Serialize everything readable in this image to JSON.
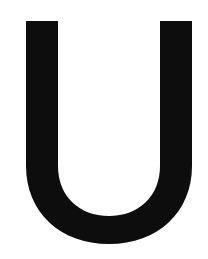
{
  "image": {
    "kind": "scanned-letterform",
    "subject": "capital letter U",
    "character": "U",
    "alt_text": "U",
    "width_px": 208,
    "height_px": 259
  },
  "colors": {
    "background": "#ffffff",
    "ink": "#0d0d0d",
    "ink_edge": "#1a1a1a"
  },
  "glyph": {
    "name": "letter-u",
    "case": "uppercase",
    "style": "sans-serif grotesque, very heavy weight",
    "counter_fill": "#ffffff",
    "metrics": {
      "left_stem_x_start": 26,
      "left_stem_x_end": 58,
      "right_stem_x_start": 163,
      "right_stem_x_end": 192,
      "cap_top_y": 21,
      "outer_bottom_y": 244,
      "inner_bottom_y": 218,
      "stroke_width_px": 30,
      "bowl_stroke_width_px": 26
    },
    "outline_path": "M26,21 L58,21 L58,166 C58,196 79,216 109,216 C139,216 160,196 160,166 L160,21 L192,21 L192,166 C192,212 158,244 109,244 C60,244 26,212 26,166 Z"
  }
}
